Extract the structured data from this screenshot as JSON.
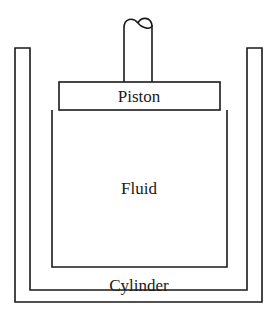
{
  "figure": {
    "background_color": "#ffffff",
    "line_color": "#1a1a1a",
    "labels": {
      "piston": "Piston",
      "fluid": "Fluid",
      "cylinder": "Cylinder"
    }
  },
  "geometry": {
    "canvas": {
      "width": 278,
      "height": 318
    },
    "outer_cylinder": {
      "left_outer_x": 15,
      "left_inner_x": 30,
      "right_inner_x": 247,
      "right_outer_x": 262,
      "top_y": 48,
      "bottom_outer_y": 302,
      "bottom_inner_y": 290
    },
    "fluid_chamber": {
      "left_x": 52,
      "right_x": 227,
      "top_y": 110,
      "bottom_y": 267
    },
    "piston_bar": {
      "left_x": 59,
      "right_x": 220,
      "top_y": 82,
      "bottom_y": 110
    },
    "piston_rod": {
      "left_x": 124,
      "right_x": 152,
      "top_y": 22,
      "bottom_y": 82,
      "break_symbol": "squiggle"
    }
  },
  "elements": [
    {
      "name": "outer-cylinder-wall",
      "shape": "u-channel"
    },
    {
      "name": "fluid-chamber",
      "shape": "rectangle-open-top"
    },
    {
      "name": "piston-bar",
      "shape": "rectangle"
    },
    {
      "name": "piston-rod",
      "shape": "vertical-bar-with-break"
    }
  ]
}
